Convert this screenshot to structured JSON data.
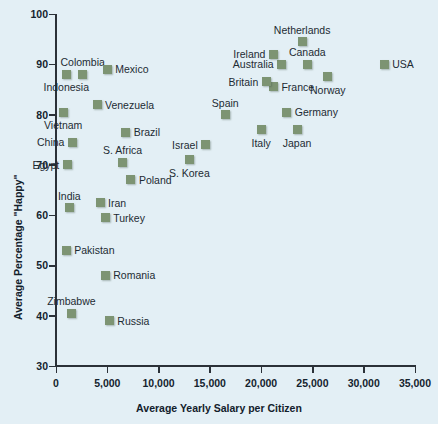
{
  "chart_data": {
    "type": "scatter",
    "title": "",
    "xlabel": "Average Yearly Salary per Citizen",
    "ylabel": "Average Percentage \"Happy\"",
    "xlim": [
      0,
      35000
    ],
    "ylim": [
      30,
      100
    ],
    "grid": false,
    "legend": "none",
    "marker_color": "#7d9473",
    "background_color": "#e3eff5",
    "axis_color": "#2b3138",
    "xticks": [
      0,
      5000,
      10000,
      15000,
      20000,
      25000,
      30000,
      35000
    ],
    "xtick_labels": [
      "0",
      "5,000",
      "10,000",
      "15,000",
      "20,000",
      "25,000",
      "30,000",
      "35,000"
    ],
    "yticks": [
      30,
      40,
      50,
      60,
      70,
      80,
      90,
      100
    ],
    "ytick_labels": [
      "30",
      "40",
      "50",
      "60",
      "70",
      "80",
      "90",
      "100"
    ],
    "points": [
      {
        "label": "Colombia",
        "x": 2600,
        "y": 88.0,
        "pos": "above"
      },
      {
        "label": "Indonesia",
        "x": 1000,
        "y": 88.0,
        "pos": "below"
      },
      {
        "label": "Mexico",
        "x": 5000,
        "y": 89.0,
        "pos": "right"
      },
      {
        "label": "Vietnam",
        "x": 700,
        "y": 80.5,
        "pos": "below"
      },
      {
        "label": "Venezuela",
        "x": 4000,
        "y": 82.0,
        "pos": "right"
      },
      {
        "label": "Brazil",
        "x": 6800,
        "y": 76.5,
        "pos": "right"
      },
      {
        "label": "China",
        "x": 1600,
        "y": 74.5,
        "pos": "left"
      },
      {
        "label": "S. Africa",
        "x": 6500,
        "y": 70.5,
        "pos": "above"
      },
      {
        "label": "Egypt",
        "x": 1100,
        "y": 70.0,
        "pos": "left"
      },
      {
        "label": "Poland",
        "x": 7300,
        "y": 67.0,
        "pos": "right"
      },
      {
        "label": "India",
        "x": 1300,
        "y": 61.5,
        "pos": "above"
      },
      {
        "label": "Iran",
        "x": 4300,
        "y": 62.5,
        "pos": "right"
      },
      {
        "label": "Turkey",
        "x": 4800,
        "y": 59.5,
        "pos": "right"
      },
      {
        "label": "Pakistan",
        "x": 1000,
        "y": 53.0,
        "pos": "right"
      },
      {
        "label": "Romania",
        "x": 4800,
        "y": 48.0,
        "pos": "right"
      },
      {
        "label": "Zimbabwe",
        "x": 1500,
        "y": 40.5,
        "pos": "above"
      },
      {
        "label": "Russia",
        "x": 5200,
        "y": 39.0,
        "pos": "right"
      },
      {
        "label": "Israel",
        "x": 14600,
        "y": 74.0,
        "pos": "left"
      },
      {
        "label": "S. Korea",
        "x": 13000,
        "y": 71.0,
        "pos": "below"
      },
      {
        "label": "Spain",
        "x": 16500,
        "y": 80.0,
        "pos": "above"
      },
      {
        "label": "Italy",
        "x": 20000,
        "y": 77.0,
        "pos": "below"
      },
      {
        "label": "Japan",
        "x": 23500,
        "y": 77.0,
        "pos": "below"
      },
      {
        "label": "Germany",
        "x": 22500,
        "y": 80.5,
        "pos": "right"
      },
      {
        "label": "France",
        "x": 21200,
        "y": 85.5,
        "pos": "right"
      },
      {
        "label": "Britain",
        "x": 20500,
        "y": 86.5,
        "pos": "left"
      },
      {
        "label": "Norway",
        "x": 26500,
        "y": 87.5,
        "pos": "below"
      },
      {
        "label": "Australia",
        "x": 22000,
        "y": 90.0,
        "pos": "left"
      },
      {
        "label": "Canada",
        "x": 24500,
        "y": 90.0,
        "pos": "above"
      },
      {
        "label": "Ireland",
        "x": 21200,
        "y": 92.0,
        "pos": "left"
      },
      {
        "label": "Netherlands",
        "x": 24000,
        "y": 94.5,
        "pos": "above"
      },
      {
        "label": "USA",
        "x": 32000,
        "y": 90.0,
        "pos": "right"
      }
    ]
  }
}
